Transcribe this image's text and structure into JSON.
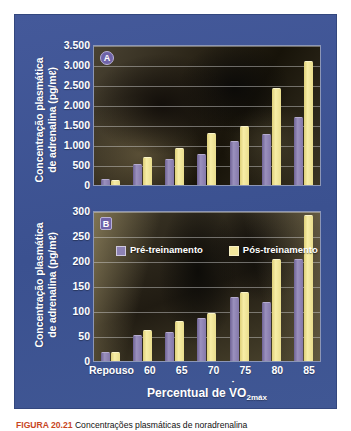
{
  "figure": {
    "caption_tag": "FIGURA 20.21",
    "caption_text": "Concentrações plasmáticas de noradrenalina"
  },
  "legend": {
    "pre_label": "Pré-treinamento",
    "post_label": "Pós-treinamento",
    "pre_color": "#8d82b4",
    "post_color": "#f3e79c"
  },
  "panel_a": {
    "badge": "A",
    "ylabel_line1": "Concentração plasmática",
    "ylabel_line2": "de adrenalina (pg/mℓ)",
    "ticks": [
      "3.500",
      "3.000",
      "2.500",
      "2.000",
      "1.500",
      "1.000",
      "500",
      "0"
    ]
  },
  "panel_b": {
    "badge": "B",
    "ylabel_line1": "Concentração plasmática",
    "ylabel_line2": "de adrenalina (pg/mℓ)",
    "ticks": [
      "300",
      "250",
      "200",
      "150",
      "100",
      "50",
      "0"
    ],
    "xlabels": [
      "Repouso",
      "60",
      "65",
      "70",
      "75",
      "80",
      "85"
    ],
    "xtitle_prefix": "Percentual de ",
    "xtitle_v": "V",
    "xtitle_o": "O",
    "xtitle_sub": "2máx"
  },
  "chart_data": [
    {
      "id": "panel_a",
      "type": "bar",
      "title": "A",
      "xlabel": "Percentual de VO2máx",
      "ylabel": "Concentração plasmática de adrenalina (pg/mℓ)",
      "categories": [
        "Repouso",
        "60",
        "65",
        "70",
        "75",
        "80",
        "85"
      ],
      "ylim": [
        0,
        3500
      ],
      "ytick_step": 500,
      "yticks": [
        0,
        500,
        1000,
        1500,
        2000,
        2500,
        3000,
        3500
      ],
      "grid": true,
      "legend_position": "none",
      "series": [
        {
          "name": "Pré-treinamento",
          "color": "#8d82b4",
          "values": [
            150,
            530,
            650,
            780,
            1100,
            1270,
            1680
          ]
        },
        {
          "name": "Pós-treinamento",
          "color": "#f3e79c",
          "values": [
            120,
            700,
            910,
            1280,
            1470,
            2400,
            3070
          ]
        }
      ]
    },
    {
      "id": "panel_b",
      "type": "bar",
      "title": "B",
      "xlabel": "Percentual de VO2máx",
      "ylabel": "Concentração plasmática de adrenalina (pg/mℓ)",
      "categories": [
        "Repouso",
        "60",
        "65",
        "70",
        "75",
        "80",
        "85"
      ],
      "ylim": [
        0,
        300
      ],
      "ytick_step": 50,
      "yticks": [
        0,
        50,
        100,
        150,
        200,
        250,
        300
      ],
      "grid": true,
      "legend_position": "inside-top-left",
      "series": [
        {
          "name": "Pré-treinamento",
          "color": "#8d82b4",
          "values": [
            18,
            52,
            57,
            85,
            128,
            118,
            202
          ]
        },
        {
          "name": "Pós-treinamento",
          "color": "#f3e79c",
          "values": [
            17,
            62,
            80,
            95,
            137,
            203,
            290
          ]
        }
      ]
    }
  ]
}
